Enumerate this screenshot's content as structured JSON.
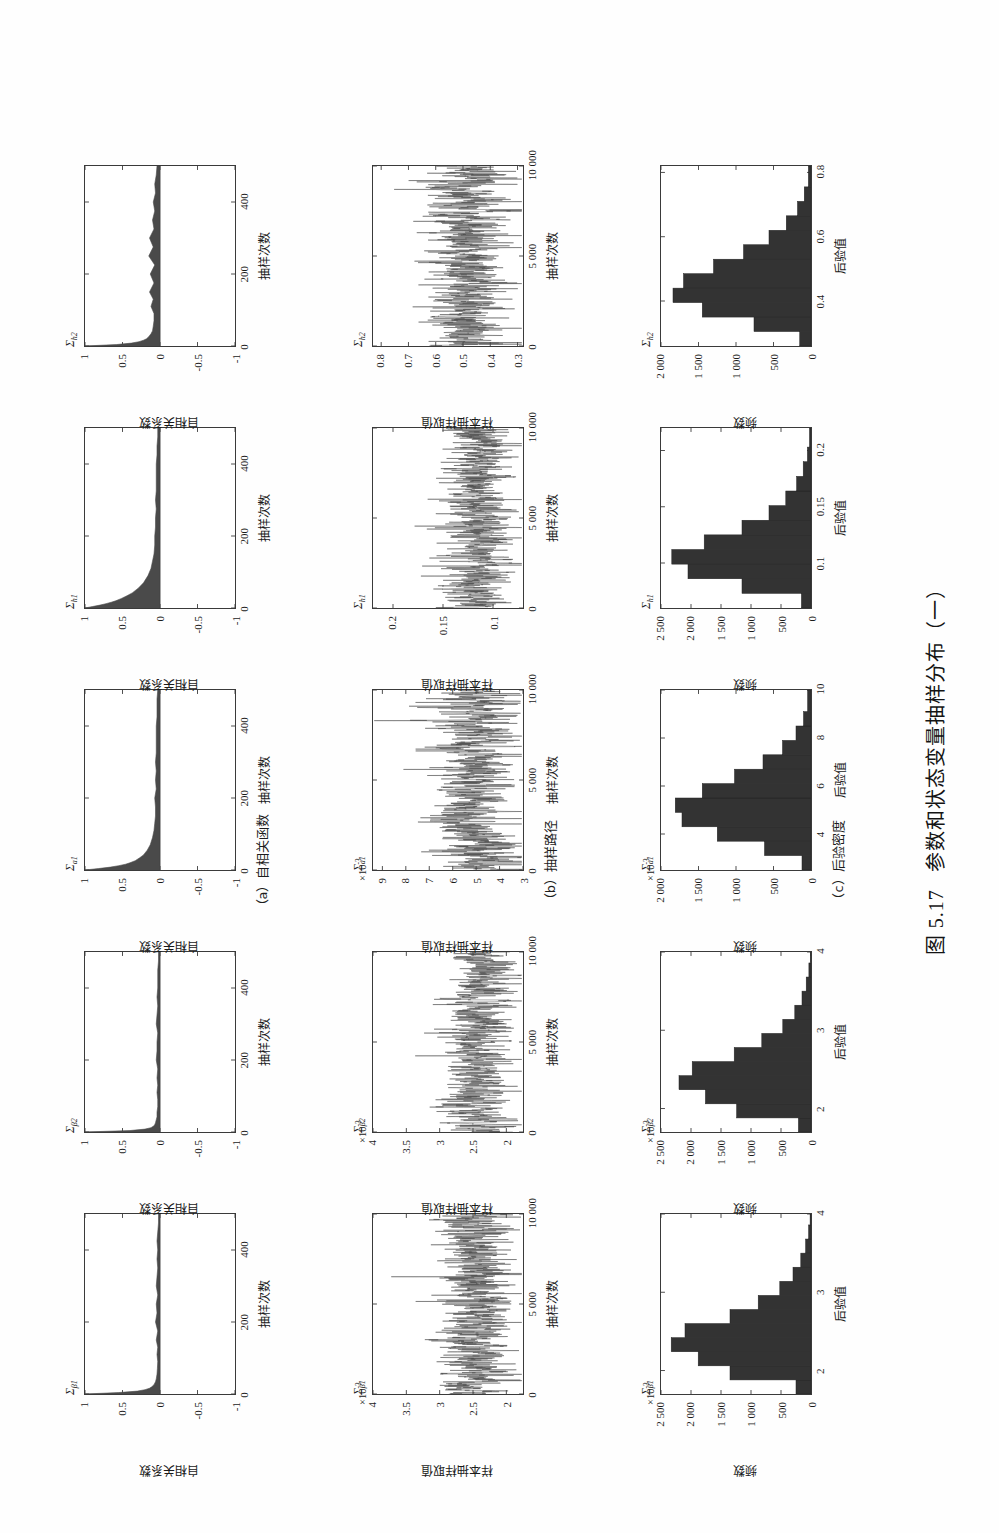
{
  "figure": {
    "caption": "图 5.17  参数和状态变量抽样分布（一）",
    "caption_number": "图 5.17",
    "caption_text": "参数和状态变量抽样分布（一）"
  },
  "panel_captions": {
    "a": "（a）自相关函数",
    "b": "（b）抽样路径",
    "c": "（c）后验密度"
  },
  "axis_names": {
    "acf_x": "抽样次数",
    "acf_y": "自相关系数",
    "trace_x": "抽样次数",
    "trace_y": "样本抽样取值",
    "hist_x": "后验值",
    "hist_y": "频数"
  },
  "columns": [
    {
      "key": "beta1",
      "title_sigma": "Σ",
      "title_sub": "β1"
    },
    {
      "key": "beta2",
      "title_sigma": "Σ",
      "title_sub": "β2"
    },
    {
      "key": "a1",
      "title_sigma": "Σ",
      "title_sub": "a1"
    },
    {
      "key": "h1",
      "title_sigma": "Σ",
      "title_sub": "h1"
    },
    {
      "key": "h2",
      "title_sigma": "Σ",
      "title_sub": "h2"
    }
  ],
  "chart_data": [
    {
      "type": "area",
      "row": "acf",
      "column": "beta1",
      "title": "Σβ1",
      "xlabel": "抽样次数",
      "ylabel": "自相关系数",
      "xlim": [
        0,
        500
      ],
      "ylim": [
        -1,
        1
      ],
      "xticks": [
        "0",
        "200",
        "400"
      ],
      "xtick_values": [
        0,
        200,
        400
      ],
      "yticks": [
        "1",
        "0.5",
        "0",
        "-0.5",
        "-1"
      ],
      "ytick_values": [
        1,
        0.5,
        0,
        -0.5,
        -1
      ],
      "exponent": "",
      "lags": [
        0,
        4,
        8,
        12,
        16,
        20,
        26,
        34,
        42,
        55,
        70,
        90,
        110,
        130,
        150,
        175,
        200,
        225,
        250,
        275,
        300,
        325,
        350,
        375,
        400,
        425,
        450,
        475,
        500
      ],
      "values": [
        1.0,
        0.55,
        0.3,
        0.2,
        0.14,
        0.11,
        0.08,
        0.06,
        0.05,
        0.04,
        0.035,
        0.03,
        0.04,
        0.03,
        0.05,
        0.03,
        0.06,
        0.04,
        0.05,
        0.03,
        0.05,
        0.04,
        0.03,
        0.04,
        0.03,
        0.04,
        0.03,
        0.02,
        0.02
      ]
    },
    {
      "type": "area",
      "row": "acf",
      "column": "beta2",
      "title": "Σβ2",
      "xlabel": "抽样次数",
      "ylabel": "自相关系数",
      "xlim": [
        0,
        500
      ],
      "ylim": [
        -1,
        1
      ],
      "xticks": [
        "0",
        "200",
        "400"
      ],
      "xtick_values": [
        0,
        200,
        400
      ],
      "yticks": [
        "1",
        "0.5",
        "0",
        "-0.5",
        "-1"
      ],
      "ytick_values": [
        1,
        0.5,
        0,
        -0.5,
        -1
      ],
      "exponent": "",
      "lags": [
        0,
        4,
        8,
        12,
        16,
        20,
        26,
        34,
        42,
        55,
        70,
        90,
        110,
        130,
        150,
        175,
        200,
        225,
        250,
        275,
        300,
        325,
        350,
        375,
        400,
        425,
        450,
        475,
        500
      ],
      "values": [
        1.0,
        0.4,
        0.2,
        0.12,
        0.09,
        0.07,
        0.06,
        0.05,
        0.04,
        0.04,
        0.03,
        0.03,
        0.04,
        0.03,
        0.04,
        0.03,
        0.05,
        0.04,
        0.04,
        0.03,
        0.05,
        0.04,
        0.03,
        0.04,
        0.03,
        0.03,
        0.03,
        0.02,
        0.02
      ]
    },
    {
      "type": "area",
      "row": "acf",
      "column": "a1",
      "title": "Σa1",
      "xlabel": "抽样次数",
      "ylabel": "自相关系数",
      "xlim": [
        0,
        500
      ],
      "ylim": [
        -1,
        1
      ],
      "xticks": [
        "0",
        "200",
        "400"
      ],
      "xtick_values": [
        0,
        200,
        400
      ],
      "yticks": [
        "1",
        "0.5",
        "0",
        "-0.5",
        "-1"
      ],
      "ytick_values": [
        1,
        0.5,
        0,
        -0.5,
        -1
      ],
      "exponent": "",
      "lags": [
        0,
        4,
        8,
        12,
        16,
        20,
        26,
        34,
        42,
        55,
        70,
        90,
        110,
        130,
        150,
        175,
        200,
        225,
        250,
        275,
        300,
        325,
        350,
        375,
        400,
        425,
        450,
        475,
        500
      ],
      "values": [
        1.0,
        0.82,
        0.66,
        0.55,
        0.46,
        0.4,
        0.33,
        0.27,
        0.22,
        0.17,
        0.13,
        0.1,
        0.08,
        0.07,
        0.06,
        0.06,
        0.07,
        0.05,
        0.06,
        0.05,
        0.06,
        0.05,
        0.05,
        0.05,
        0.05,
        0.04,
        0.04,
        0.04,
        0.03
      ]
    },
    {
      "type": "area",
      "row": "acf",
      "column": "h1",
      "title": "Σh1",
      "xlabel": "抽样次数",
      "ylabel": "自相关系数",
      "xlim": [
        0,
        500
      ],
      "ylim": [
        -1,
        1
      ],
      "xticks": [
        "0",
        "200",
        "400"
      ],
      "xtick_values": [
        0,
        200,
        400
      ],
      "yticks": [
        "1",
        "0.5",
        "0",
        "-0.5",
        "-1"
      ],
      "ytick_values": [
        1,
        0.5,
        0,
        -0.5,
        -1
      ],
      "exponent": "",
      "lags": [
        0,
        4,
        8,
        12,
        16,
        20,
        26,
        34,
        42,
        55,
        70,
        90,
        110,
        130,
        150,
        175,
        200,
        225,
        250,
        275,
        300,
        325,
        350,
        375,
        400,
        425,
        450,
        475,
        500
      ],
      "values": [
        1.0,
        0.9,
        0.8,
        0.72,
        0.65,
        0.59,
        0.52,
        0.44,
        0.37,
        0.29,
        0.22,
        0.16,
        0.12,
        0.1,
        0.08,
        0.07,
        0.07,
        0.06,
        0.06,
        0.05,
        0.06,
        0.05,
        0.05,
        0.05,
        0.05,
        0.04,
        0.04,
        0.03,
        0.03
      ]
    },
    {
      "type": "area",
      "row": "acf",
      "column": "h2",
      "title": "Σh2",
      "xlabel": "抽样次数",
      "ylabel": "自相关系数",
      "xlim": [
        0,
        500
      ],
      "ylim": [
        -1,
        1
      ],
      "xticks": [
        "0",
        "200",
        "400"
      ],
      "xtick_values": [
        0,
        200,
        400
      ],
      "yticks": [
        "1",
        "0.5",
        "0",
        "-0.5",
        "-1"
      ],
      "ytick_values": [
        1,
        0.5,
        0,
        -0.5,
        -1
      ],
      "exponent": "",
      "lags": [
        0,
        4,
        8,
        12,
        16,
        20,
        26,
        34,
        42,
        55,
        70,
        90,
        110,
        130,
        150,
        175,
        200,
        225,
        250,
        275,
        300,
        325,
        350,
        375,
        400,
        425,
        450,
        475,
        500
      ],
      "values": [
        1.0,
        0.58,
        0.38,
        0.28,
        0.22,
        0.18,
        0.15,
        0.12,
        0.1,
        0.09,
        0.08,
        0.08,
        0.12,
        0.09,
        0.14,
        0.08,
        0.13,
        0.07,
        0.15,
        0.09,
        0.14,
        0.08,
        0.1,
        0.07,
        0.09,
        0.06,
        0.07,
        0.05,
        0.04
      ]
    },
    {
      "type": "line",
      "row": "trace",
      "column": "beta1",
      "title": "Σβ1",
      "xlabel": "抽样次数",
      "ylabel": "样本抽样取值",
      "xlim": [
        0,
        10000
      ],
      "ylim": [
        1.75,
        4
      ],
      "xticks": [
        "0",
        "5 000",
        "10 000"
      ],
      "xtick_values": [
        0,
        5000,
        10000
      ],
      "yticks": [
        "4",
        "3.5",
        "3",
        "2.5",
        "2"
      ],
      "ytick_values": [
        4,
        3.5,
        3,
        2.5,
        2
      ],
      "exponent": "×10⁻³",
      "mean": 2.45,
      "noise_sd": 0.28,
      "seed": 11
    },
    {
      "type": "line",
      "row": "trace",
      "column": "beta2",
      "title": "Σβ2",
      "xlabel": "抽样次数",
      "ylabel": "样本抽样取值",
      "xlim": [
        0,
        10000
      ],
      "ylim": [
        1.75,
        4
      ],
      "xticks": [
        "0",
        "5 000",
        "10 000"
      ],
      "xtick_values": [
        0,
        5000,
        10000
      ],
      "yticks": [
        "4",
        "3.5",
        "3",
        "2.5",
        "2"
      ],
      "ytick_values": [
        4,
        3.5,
        3,
        2.5,
        2
      ],
      "exponent": "×10⁻³",
      "mean": 2.4,
      "noise_sd": 0.26,
      "seed": 23
    },
    {
      "type": "line",
      "row": "trace",
      "column": "a1",
      "title": "Σa1",
      "xlabel": "抽样次数",
      "ylabel": "样本抽样取值",
      "xlim": [
        0,
        10000
      ],
      "ylim": [
        3,
        9.4
      ],
      "xticks": [
        "0",
        "5 000",
        "10 000"
      ],
      "xtick_values": [
        0,
        5000,
        10000
      ],
      "yticks": [
        "9",
        "8",
        "7",
        "6",
        "5",
        "4",
        "3"
      ],
      "ytick_values": [
        9,
        8,
        7,
        6,
        5,
        4,
        3
      ],
      "exponent": "×10⁻³",
      "mean": 5.1,
      "noise_sd": 0.85,
      "seed": 37
    },
    {
      "type": "line",
      "row": "trace",
      "column": "h1",
      "title": "Σh1",
      "xlabel": "抽样次数",
      "ylabel": "样本抽样取值",
      "xlim": [
        0,
        10000
      ],
      "ylim": [
        0.07,
        0.22
      ],
      "xticks": [
        "0",
        "5 000",
        "10 000"
      ],
      "xtick_values": [
        0,
        5000,
        10000
      ],
      "yticks": [
        "0.2",
        "0.15",
        "0.1"
      ],
      "ytick_values": [
        0.2,
        0.15,
        0.1
      ],
      "exponent": "",
      "mean": 0.115,
      "noise_sd": 0.017,
      "seed": 59
    },
    {
      "type": "line",
      "row": "trace",
      "column": "h2",
      "title": "Σh2",
      "xlabel": "抽样次数",
      "ylabel": "样本抽样取值",
      "xlim": [
        0,
        10000
      ],
      "ylim": [
        0.28,
        0.83
      ],
      "xticks": [
        "0",
        "5 000",
        "10 000"
      ],
      "xtick_values": [
        0,
        5000,
        10000
      ],
      "yticks": [
        "0.8",
        "0.7",
        "0.6",
        "0.5",
        "0.4",
        "0.3"
      ],
      "ytick_values": [
        0.8,
        0.7,
        0.6,
        0.5,
        0.4,
        0.3
      ],
      "exponent": "",
      "mean": 0.48,
      "noise_sd": 0.072,
      "seed": 71
    },
    {
      "type": "bar",
      "row": "hist",
      "column": "beta1",
      "title": "Σβ1",
      "xlabel": "后验值",
      "ylabel": "频数",
      "xlim": [
        1.7,
        4
      ],
      "ylim": [
        0,
        2500
      ],
      "xticks": [
        "2",
        "3",
        "4"
      ],
      "xtick_values": [
        2,
        3,
        4
      ],
      "yticks": [
        "2 500",
        "2 000",
        "1 500",
        "1 000",
        "500",
        "0"
      ],
      "ytick_values": [
        2500,
        2000,
        1500,
        1000,
        500,
        0
      ],
      "exponent": "×10⁻³",
      "bin_edges": [
        1.7,
        1.88,
        2.06,
        2.24,
        2.42,
        2.6,
        2.78,
        2.96,
        3.14,
        3.32,
        3.5,
        3.68,
        3.86,
        4.0
      ],
      "values": [
        250,
        1350,
        1880,
        2330,
        2100,
        1350,
        880,
        520,
        300,
        170,
        90,
        40,
        15
      ]
    },
    {
      "type": "bar",
      "row": "hist",
      "column": "beta2",
      "title": "Σβ2",
      "xlabel": "后验值",
      "ylabel": "频数",
      "xlim": [
        1.7,
        4
      ],
      "ylim": [
        0,
        2500
      ],
      "xticks": [
        "2",
        "3",
        "4"
      ],
      "xtick_values": [
        2,
        3,
        4
      ],
      "yticks": [
        "2 500",
        "2 000",
        "1 500",
        "1 000",
        "500",
        "0"
      ],
      "ytick_values": [
        2500,
        2000,
        1500,
        1000,
        500,
        0
      ],
      "exponent": "×10⁻³",
      "bin_edges": [
        1.7,
        1.88,
        2.06,
        2.24,
        2.42,
        2.6,
        2.78,
        2.96,
        3.14,
        3.32,
        3.5,
        3.68,
        3.86,
        4.0
      ],
      "values": [
        210,
        1240,
        1760,
        2200,
        1980,
        1280,
        820,
        470,
        270,
        150,
        80,
        35,
        12
      ]
    },
    {
      "type": "bar",
      "row": "hist",
      "column": "a1",
      "title": "Σa1",
      "xlabel": "后验值",
      "ylabel": "频数",
      "xlim": [
        2.5,
        10
      ],
      "ylim": [
        0,
        2000
      ],
      "xticks": [
        "4",
        "6",
        "8",
        "10"
      ],
      "xtick_values": [
        4,
        6,
        8,
        10
      ],
      "yticks": [
        "2 000",
        "1 500",
        "1 000",
        "500",
        "0"
      ],
      "ytick_values": [
        2000,
        1500,
        1000,
        500,
        0
      ],
      "exponent": "×10⁻³",
      "bin_edges": [
        2.5,
        3.1,
        3.7,
        4.3,
        4.9,
        5.5,
        6.1,
        6.7,
        7.3,
        7.9,
        8.5,
        9.1,
        10.0
      ],
      "values": [
        120,
        620,
        1250,
        1720,
        1810,
        1450,
        1020,
        640,
        380,
        200,
        100,
        45
      ]
    },
    {
      "type": "bar",
      "row": "hist",
      "column": "h1",
      "title": "Σh1",
      "xlabel": "后验值",
      "ylabel": "频数",
      "xlim": [
        0.06,
        0.22
      ],
      "ylim": [
        0,
        2500
      ],
      "xticks": [
        "0.1",
        "0.15",
        "0.2"
      ],
      "xtick_values": [
        0.1,
        0.15,
        0.2
      ],
      "yticks": [
        "2 500",
        "2 000",
        "1 500",
        "1 000",
        "500",
        "0"
      ],
      "ytick_values": [
        2500,
        2000,
        1500,
        1000,
        500,
        0
      ],
      "exponent": "",
      "bin_edges": [
        0.06,
        0.073,
        0.086,
        0.099,
        0.112,
        0.125,
        0.138,
        0.151,
        0.164,
        0.177,
        0.19,
        0.203,
        0.22
      ],
      "values": [
        160,
        1150,
        2050,
        2320,
        1780,
        1150,
        700,
        420,
        240,
        130,
        60,
        25
      ]
    },
    {
      "type": "bar",
      "row": "hist",
      "column": "h2",
      "title": "Σh2",
      "xlabel": "后验值",
      "ylabel": "频数",
      "xlim": [
        0.26,
        0.82
      ],
      "ylim": [
        0,
        2000
      ],
      "xticks": [
        "0.4",
        "0.6",
        "0.8"
      ],
      "xtick_values": [
        0.4,
        0.6,
        0.8
      ],
      "yticks": [
        "2 000",
        "1 500",
        "1 000",
        "500",
        "0"
      ],
      "ytick_values": [
        2000,
        1500,
        1000,
        500,
        0
      ],
      "exponent": "",
      "bin_edges": [
        0.26,
        0.305,
        0.35,
        0.395,
        0.44,
        0.485,
        0.53,
        0.575,
        0.62,
        0.665,
        0.71,
        0.755,
        0.82
      ],
      "values": [
        150,
        760,
        1450,
        1840,
        1700,
        1300,
        900,
        560,
        330,
        180,
        90,
        35
      ]
    }
  ]
}
